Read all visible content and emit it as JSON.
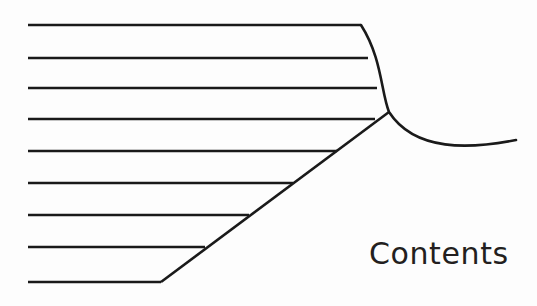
{
  "page": {
    "width": 537,
    "height": 306,
    "background_color": "#fdfdfd",
    "ink_color": "#1a1a1a"
  },
  "heading": {
    "text": "Contents",
    "color": "#231f20",
    "font_size_px": 30,
    "x": 369,
    "y": 239
  },
  "figure": {
    "name": "contents-ruled-lines-figure",
    "line_color": "#1a1a1a",
    "line_width": 2.6,
    "horizontal_lines": [
      {
        "index": 1,
        "x1": 28,
        "y1": 25,
        "x2": 361,
        "y2": 25
      },
      {
        "index": 2,
        "x1": 28,
        "y1": 58,
        "x2": 368,
        "y2": 58
      },
      {
        "index": 3,
        "x1": 28,
        "y1": 88,
        "x2": 377,
        "y2": 88
      },
      {
        "index": 4,
        "x1": 28,
        "y1": 119,
        "x2": 375,
        "y2": 119
      },
      {
        "index": 5,
        "x1": 28,
        "y1": 151,
        "x2": 337,
        "y2": 151
      },
      {
        "index": 6,
        "x1": 28,
        "y1": 183,
        "x2": 293,
        "y2": 183
      },
      {
        "index": 7,
        "x1": 28,
        "y1": 215,
        "x2": 249,
        "y2": 215
      },
      {
        "index": 8,
        "x1": 28,
        "y1": 247,
        "x2": 205,
        "y2": 247
      },
      {
        "index": 9,
        "x1": 28,
        "y1": 282,
        "x2": 161,
        "y2": 282
      }
    ],
    "diagonal_line": {
      "x1": 389,
      "y1": 112,
      "x2": 161,
      "y2": 282
    },
    "curve": {
      "start": {
        "x": 361,
        "y": 25
      },
      "control_1": {
        "x": 382,
        "y": 58
      },
      "control_2": {
        "x": 381,
        "y": 92
      },
      "junction": {
        "x": 389,
        "y": 112
      },
      "sweep_control_1": {
        "x": 415,
        "y": 152
      },
      "sweep_control_2": {
        "x": 470,
        "y": 149
      },
      "end": {
        "x": 516,
        "y": 140
      }
    }
  }
}
